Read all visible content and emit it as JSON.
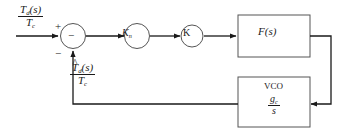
{
  "diagram": {
    "type": "control-system-block-diagram",
    "background_color": "#ffffff",
    "line_color": "#1a1a1a",
    "signals": {
      "input": {
        "numerator": "T",
        "numerator_sub": "d",
        "numerator_arg": "(s)",
        "denominator": "T",
        "denominator_sub": "c",
        "accent": ""
      },
      "feedback": {
        "numerator": "T",
        "numerator_sub": "d",
        "numerator_arg": "(s)",
        "denominator": "T",
        "denominator_sub": "c",
        "accent": "^"
      }
    },
    "summing_junction": {
      "name": "summing-junction",
      "input_sign": "+",
      "feedback_sign": "−",
      "inner_symbol": "−"
    },
    "blocks": [
      {
        "name": "gain-kn",
        "shape": "circle",
        "label": "K",
        "label_sub": "n"
      },
      {
        "name": "gain-k",
        "shape": "circle",
        "label": "K",
        "label_sub": ""
      },
      {
        "name": "filter-fs",
        "shape": "rectangle",
        "label": "F(s)",
        "label_sub": ""
      },
      {
        "name": "vco",
        "shape": "rectangle",
        "label": "VCO",
        "gain_numerator": "g",
        "gain_numerator_sub": "c",
        "gain_denominator": "s"
      }
    ]
  }
}
